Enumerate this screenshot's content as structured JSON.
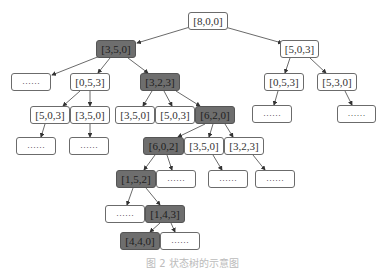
{
  "diagram": {
    "type": "state-tree",
    "nodes": {
      "root": {
        "label": "[8,0,0]",
        "highlighted": false
      },
      "n350": {
        "label": "[3,5,0]",
        "highlighted": true
      },
      "n503": {
        "label": "[5,0,3]",
        "highlighted": false
      },
      "l_dots": {
        "label": "……",
        "highlighted": false
      },
      "l_053": {
        "label": "[0,5,3]",
        "highlighted": false
      },
      "l_323": {
        "label": "[3,2,3]",
        "highlighted": true
      },
      "r_053": {
        "label": "[0,5,3]",
        "highlighted": false
      },
      "r_530": {
        "label": "[5,3,0]",
        "highlighted": false
      },
      "a_503": {
        "label": "[5,0,3]",
        "highlighted": false
      },
      "a_350": {
        "label": "[3,5,0]",
        "highlighted": false
      },
      "b_350": {
        "label": "[3,5,0]",
        "highlighted": false
      },
      "b_503": {
        "label": "[5,0,3]",
        "highlighted": false
      },
      "b_620": {
        "label": "[6,2,0]",
        "highlighted": true
      },
      "r_053_dots": {
        "label": "……",
        "highlighted": false
      },
      "r_530_dots": {
        "label": "……",
        "highlighted": false
      },
      "a_503_dots": {
        "label": "……",
        "highlighted": false
      },
      "a_350_dots": {
        "label": "……",
        "highlighted": false
      },
      "c_602": {
        "label": "[6,0,2]",
        "highlighted": true
      },
      "c_350": {
        "label": "[3,5,0]",
        "highlighted": false
      },
      "c_323": {
        "label": "[3,2,3]",
        "highlighted": false
      },
      "d_152": {
        "label": "[1,5,2]",
        "highlighted": true
      },
      "d_dots": {
        "label": "……",
        "highlighted": false
      },
      "c_350_dots": {
        "label": "……",
        "highlighted": false
      },
      "c_323_dots": {
        "label": "……",
        "highlighted": false
      },
      "e_dots": {
        "label": "……",
        "highlighted": false
      },
      "e_143": {
        "label": "[1,4,3]",
        "highlighted": true
      },
      "f_440": {
        "label": "[4,4,0]",
        "highlighted": true
      },
      "f_dots": {
        "label": "……",
        "highlighted": false
      }
    },
    "caption": "图 2  状态树的示意图",
    "colors": {
      "highlight": "#6e6e6e",
      "normal": "#ffffff",
      "edge": "#444444"
    }
  }
}
